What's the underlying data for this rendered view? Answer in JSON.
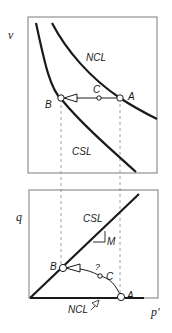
{
  "figure": {
    "type": "critical-state soil mechanics diagram",
    "upper_plot": {
      "y_axis_label": "v",
      "curves": [
        {
          "name": "NCL",
          "label": "NCL"
        },
        {
          "name": "CSL",
          "label": "CSL"
        }
      ],
      "points": [
        {
          "id": "A",
          "label": "A"
        },
        {
          "id": "B",
          "label": "B"
        },
        {
          "id": "C",
          "label": "C"
        }
      ]
    },
    "lower_plot": {
      "y_axis_label": "q",
      "x_axis_label": "p'",
      "lines": [
        {
          "name": "CSL",
          "label": "CSL",
          "slope_label": "M"
        },
        {
          "name": "NCL",
          "label": "NCL"
        }
      ],
      "points": [
        {
          "id": "A",
          "label": "A"
        },
        {
          "id": "B",
          "label": "B"
        },
        {
          "id": "C",
          "label": "C"
        }
      ],
      "question_mark": "?"
    },
    "colors": {
      "line": "#1a1a1a",
      "frame": "#7a7a7a",
      "dashed": "#8a8a8a"
    }
  }
}
